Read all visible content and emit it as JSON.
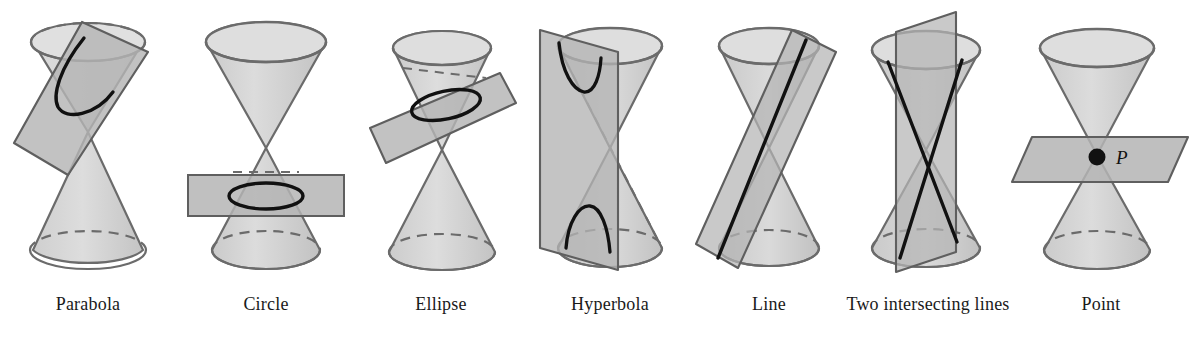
{
  "diagram": {
    "background_color": "#ffffff",
    "palette": {
      "cone_fill_light": "#d9d9d9",
      "cone_fill_mid": "#c9c9c9",
      "cone_outline": "#6b6b6b",
      "plane_fill": "#b4b4b4",
      "plane_outline": "#6b6b6b",
      "curve_stroke": "#111111",
      "label_color": "#1a1a1a"
    },
    "panels": [
      {
        "id": "parabola",
        "label": "Parabola",
        "center_x": 88,
        "conic_type": "parabola",
        "plane_orientation": "tilted parallel to a generating line",
        "cuts_nappes": 1,
        "curve_description": "open U-shaped curve on the upper nappe"
      },
      {
        "id": "circle",
        "label": "Circle",
        "center_x": 268,
        "conic_type": "circle",
        "plane_orientation": "horizontal, perpendicular to the axis",
        "cuts_nappes": 1,
        "curve_description": "closed circle seen in perspective as an ellipse"
      },
      {
        "id": "ellipse",
        "label": "Ellipse",
        "center_x": 430,
        "conic_type": "ellipse",
        "plane_orientation": "tilted, oblique to the axis",
        "cuts_nappes": 1,
        "curve_description": "closed oval curve on the upper nappe"
      },
      {
        "id": "hyperbola",
        "label": "Hyperbola",
        "center_x": 600,
        "conic_type": "hyperbola",
        "plane_orientation": "vertical, parallel to the axis",
        "cuts_nappes": 2,
        "curve_description": "two opposing branches, one on each nappe"
      },
      {
        "id": "line",
        "label": "Line",
        "center_x": 765,
        "conic_type": "degenerate-line",
        "plane_orientation": "tangent plane touching along a generator",
        "cuts_nappes": 2,
        "curve_description": "single straight line along the cone surface"
      },
      {
        "id": "two-intersecting-lines",
        "label": "Two intersecting lines",
        "center_x": 915,
        "conic_type": "degenerate-two-lines",
        "plane_orientation": "vertical plane through the apex",
        "cuts_nappes": 2,
        "curve_description": "two straight lines crossing at the apex"
      },
      {
        "id": "point",
        "label": "Point",
        "center_x": 1095,
        "conic_type": "degenerate-point",
        "plane_orientation": "horizontal plane through the apex",
        "cuts_nappes": 0,
        "curve_description": "a single point at the apex",
        "point_label": "P"
      }
    ]
  }
}
